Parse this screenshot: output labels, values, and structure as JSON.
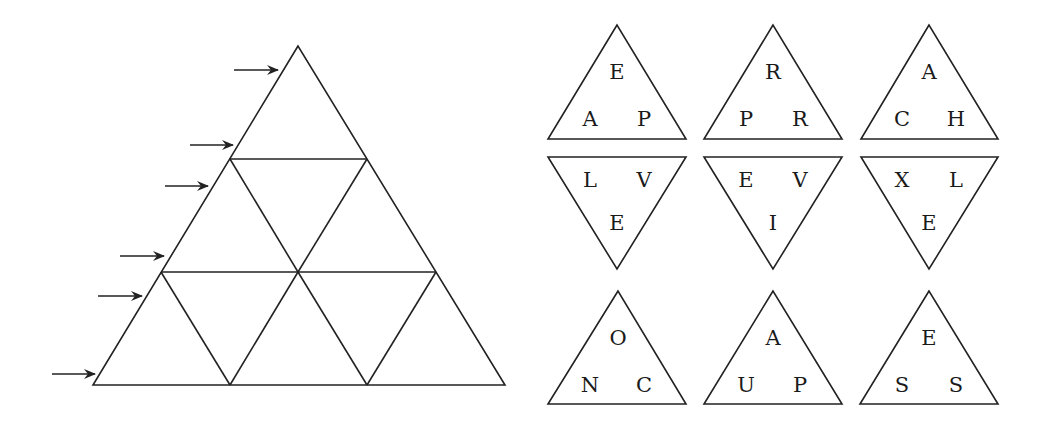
{
  "puzzle": {
    "grid": {
      "rows": 3,
      "arrow_count": 6
    },
    "pieces": [
      {
        "orientation": "up",
        "top": "E",
        "left": "A",
        "right": "P"
      },
      {
        "orientation": "up",
        "top": "R",
        "left": "P",
        "right": "R"
      },
      {
        "orientation": "up",
        "top": "A",
        "left": "C",
        "right": "H"
      },
      {
        "orientation": "down",
        "left": "L",
        "right": "V",
        "bottom": "E"
      },
      {
        "orientation": "down",
        "left": "E",
        "right": "V",
        "bottom": "I"
      },
      {
        "orientation": "down",
        "left": "X",
        "right": "L",
        "bottom": "E"
      },
      {
        "orientation": "up",
        "top": "O",
        "left": "N",
        "right": "C"
      },
      {
        "orientation": "up",
        "top": "A",
        "left": "U",
        "right": "P"
      },
      {
        "orientation": "up",
        "top": "E",
        "left": "S",
        "right": "S"
      }
    ]
  }
}
